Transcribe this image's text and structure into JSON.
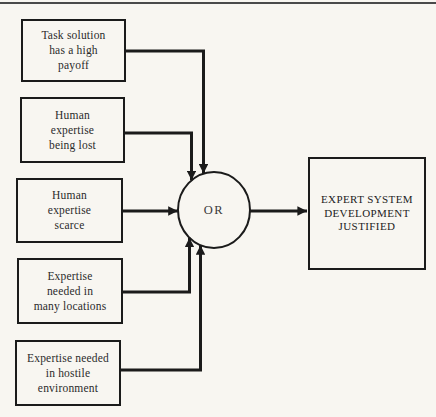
{
  "figure": {
    "background_color": "#f8f6f1",
    "line_color": "#1b1b1b",
    "inputs": [
      {
        "text": "Task solution\nhas a high\npayoff"
      },
      {
        "text": "Human\nexpertise\nbeing lost"
      },
      {
        "text": "Human\nexpertise\nscarce"
      },
      {
        "text": "Expertise\nneeded in\nmany locations"
      },
      {
        "text": "Expertise needed\nin hostile\nenvironment"
      }
    ],
    "gate": {
      "label": "OR"
    },
    "output": {
      "text": "EXPERT SYSTEM\nDEVELOPMENT\nJUSTIFIED"
    }
  }
}
